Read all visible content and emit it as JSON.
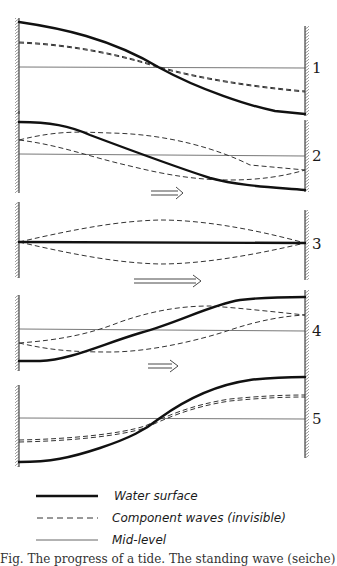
{
  "figure": {
    "panels": [
      {
        "id": "1",
        "label": "1",
        "state": "high water at left, low at right (standing wave, component waves aligned)",
        "has_arrow": false
      },
      {
        "id": "2",
        "label": "2",
        "state": "component waves shifting, surface tilting",
        "has_arrow": true,
        "arrow": "right-arrow"
      },
      {
        "id": "3",
        "label": "3",
        "state": "water surface flat at mid-level, component waves opposite",
        "has_arrow": true,
        "arrow": "right-arrow"
      },
      {
        "id": "4",
        "label": "4",
        "state": "surface rising at right",
        "has_arrow": true,
        "arrow": "right-arrow"
      },
      {
        "id": "5",
        "label": "5",
        "state": "high water at right, low at left",
        "has_arrow": false
      }
    ],
    "legend": [
      {
        "style": "thick-solid",
        "label": "Water surface"
      },
      {
        "style": "dashed",
        "label": "Component waves (invisible)"
      },
      {
        "style": "thin-solid",
        "label": "Mid-level"
      }
    ],
    "caption_partial": "Fig. The progress of a tide. The standing wave (seiche) is seen as the sum of two component waves travelling in opposite directions"
  },
  "colors": {
    "ink": "#111111",
    "background": "#ffffff"
  }
}
